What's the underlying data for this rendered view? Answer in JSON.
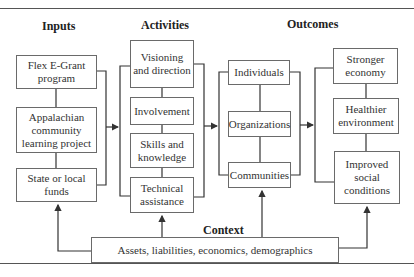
{
  "diagram": {
    "headers": {
      "inputs": "Inputs",
      "activities": "Activities",
      "outcomes": "Outcomes",
      "context": "Context"
    },
    "inputs": [
      {
        "label": "Flex E-Grant program"
      },
      {
        "label": "Appalachian community learning project"
      },
      {
        "label": "State or local funds"
      }
    ],
    "activities": [
      {
        "label": "Visioning and direction"
      },
      {
        "label": "Involvement"
      },
      {
        "label": "Skills and knowledge"
      },
      {
        "label": "Technical assistance"
      }
    ],
    "outcomes_levels": [
      {
        "label": "Individuals"
      },
      {
        "label": "Organizations"
      },
      {
        "label": "Communities"
      }
    ],
    "outcomes_results": [
      {
        "label": "Stronger economy"
      },
      {
        "label": "Healthier environment"
      },
      {
        "label": "Improved social conditions"
      }
    ],
    "context_box": {
      "label": "Assets, liabilities, economics, demographics"
    },
    "colors": {
      "line": "#333333",
      "box_border": "#6a6a6a",
      "text": "#2a2a2a"
    }
  }
}
